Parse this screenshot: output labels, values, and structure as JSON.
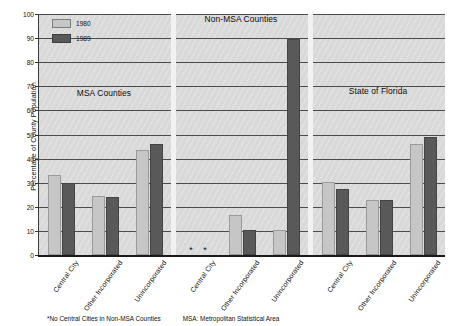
{
  "chart": {
    "ylabel": "Percentage of County Population",
    "yticks": [
      "0",
      "10",
      "20",
      "30",
      "40",
      "50",
      "60",
      "70",
      "80",
      "90",
      "100"
    ],
    "legend": [
      {
        "label": "1980",
        "color": "#c6c6c6",
        "icon": "legend-swatch-1980"
      },
      {
        "label": "1989",
        "color": "#595959",
        "icon": "legend-swatch-1989"
      }
    ],
    "sections": [
      {
        "title": "MSA Counties"
      },
      {
        "title": "Non-MSA Counties"
      },
      {
        "title": "State of Florida"
      }
    ],
    "nodata_marker": "*",
    "footnotes": [
      "*No Central Cities in Non-MSA Counties",
      "MSA: Metropolitan Statistical Area"
    ]
  },
  "chart_data": {
    "type": "bar",
    "title": "",
    "xlabel": "",
    "ylabel": "Percentage of County Population",
    "ylim": [
      0,
      100
    ],
    "ytick_step": 10,
    "grid": true,
    "legend_position": "top-left",
    "groups": [
      {
        "name": "MSA Counties",
        "categories": [
          "Central City",
          "Other Incorporated",
          "Unincorporated"
        ],
        "series": [
          {
            "name": "1980",
            "values": [
              33,
              24.5,
              43.5
            ]
          },
          {
            "name": "1989",
            "values": [
              30,
              24,
              46
            ]
          }
        ]
      },
      {
        "name": "Non-MSA Counties",
        "categories": [
          "Central City",
          "Other Incorporated",
          "Unincorporated"
        ],
        "series": [
          {
            "name": "1980",
            "values": [
              null,
              16.5,
              10.5
            ]
          },
          {
            "name": "1989",
            "values": [
              null,
              10.5,
              89.5
            ]
          }
        ]
      },
      {
        "name": "State of Florida",
        "categories": [
          "Central City",
          "Other Incorporated",
          "Unincorporated"
        ],
        "series": [
          {
            "name": "1980",
            "values": [
              30.5,
              23,
              46
            ]
          },
          {
            "name": "1989",
            "values": [
              27.5,
              23,
              49
            ]
          }
        ]
      }
    ],
    "bars": [
      {
        "group": "MSA Counties",
        "category": "Central City",
        "series": "1980",
        "value": 33
      },
      {
        "group": "MSA Counties",
        "category": "Central City",
        "series": "1989",
        "value": 30
      },
      {
        "group": "MSA Counties",
        "category": "Other Incorporated",
        "series": "1980",
        "value": 24.5
      },
      {
        "group": "MSA Counties",
        "category": "Other Incorporated",
        "series": "1989",
        "value": 24
      },
      {
        "group": "MSA Counties",
        "category": "Unincorporated",
        "series": "1980",
        "value": 43.5
      },
      {
        "group": "MSA Counties",
        "category": "Unincorporated",
        "series": "1989",
        "value": 46
      },
      {
        "group": "Non-MSA Counties",
        "category": "Central City",
        "series": "1980",
        "value": null
      },
      {
        "group": "Non-MSA Counties",
        "category": "Central City",
        "series": "1989",
        "value": null
      },
      {
        "group": "Non-MSA Counties",
        "category": "Other Incorporated",
        "series": "1980",
        "value": 16.5
      },
      {
        "group": "Non-MSA Counties",
        "category": "Other Incorporated",
        "series": "1989",
        "value": 10.5
      },
      {
        "group": "Non-MSA Counties",
        "category": "Unincorporated",
        "series": "1980",
        "value": 83.5
      },
      {
        "group": "Non-MSA Counties",
        "category": "Unincorporated",
        "series": "1989",
        "value": 89.5
      },
      {
        "group": "State of Florida",
        "category": "Central City",
        "series": "1980",
        "value": 30.5
      },
      {
        "group": "State of Florida",
        "category": "Central City",
        "series": "1989",
        "value": 27.5
      },
      {
        "group": "State of Florida",
        "category": "Other Incorporated",
        "series": "1980",
        "value": 23
      },
      {
        "group": "State of Florida",
        "category": "Other Incorporated",
        "series": "1989",
        "value": 23
      },
      {
        "group": "State of Florida",
        "category": "Unincorporated",
        "series": "1980",
        "value": 46
      },
      {
        "group": "State of Florida",
        "category": "Unincorporated",
        "series": "1989",
        "value": 49
      }
    ],
    "xtick_labels": [
      "Central City",
      "Other Incorporated",
      "Unincorporated",
      "Central City",
      "Other Incorporated",
      "Unincorporated",
      "Central City",
      "Other Incorporated",
      "Unincorporated"
    ]
  }
}
